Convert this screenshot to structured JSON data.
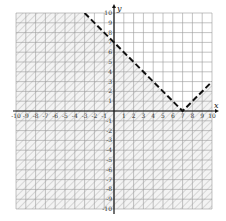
{
  "chart_data": {
    "type": "inequality-graph",
    "title": "",
    "xlabel": "x",
    "ylabel": "y",
    "xlim": [
      -10,
      10
    ],
    "ylim": [
      -10,
      10
    ],
    "grid": true,
    "x_ticks": [
      -10,
      -9,
      -8,
      -7,
      -6,
      -5,
      -4,
      -3,
      -2,
      -1,
      1,
      2,
      3,
      4,
      5,
      6,
      7,
      8,
      9,
      10
    ],
    "y_ticks": [
      -10,
      -9,
      -8,
      -7,
      -6,
      -5,
      -4,
      -3,
      -2,
      -1,
      1,
      2,
      3,
      4,
      5,
      6,
      7,
      8,
      9,
      10
    ],
    "boundary": {
      "equation": "y = |x - 7|",
      "style": "dashed",
      "vertex": [
        7,
        0
      ],
      "points": [
        [
          -3,
          10
        ],
        [
          0,
          7
        ],
        [
          7,
          0
        ],
        [
          10,
          3
        ]
      ]
    },
    "inequality": "y < |x - 7|",
    "shaded_region": "below boundary",
    "shading_style": "diagonal hatch"
  },
  "colors": {
    "grid": "#9a9a9a",
    "axis": "#111111",
    "boundary": "#111111",
    "hatch": "#a8a8a8",
    "shade_fill": "#f2f2f2",
    "background": "#ffffff"
  }
}
